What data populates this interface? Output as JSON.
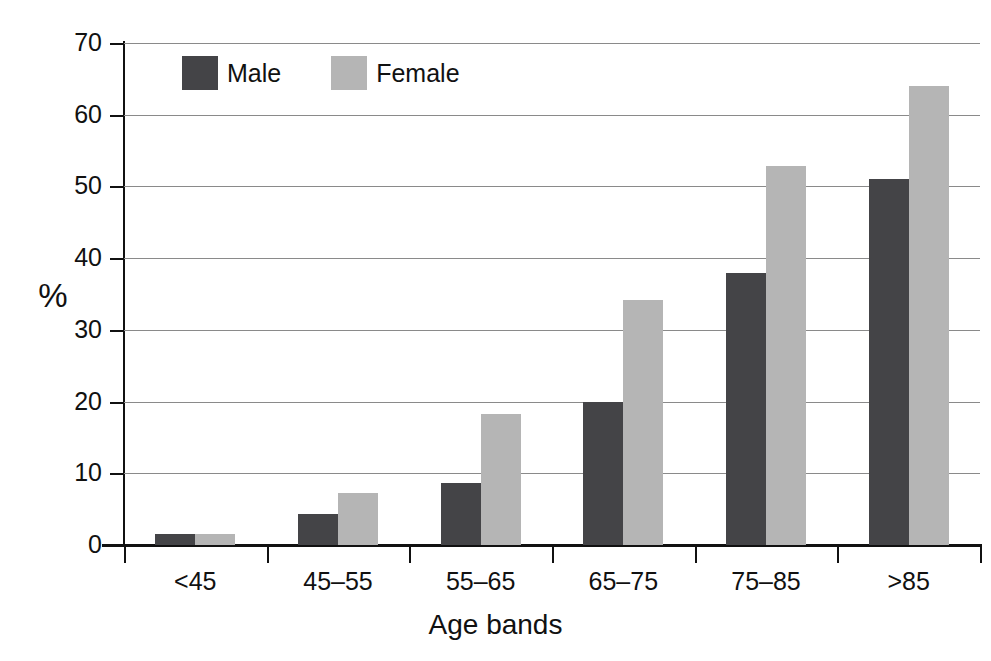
{
  "chart_data": {
    "type": "bar",
    "title": "",
    "subtitle": "",
    "xlabel": "Age bands",
    "ylabel": "%",
    "categories": [
      "<45",
      "45–55",
      "55–65",
      "65–75",
      "75–85",
      ">85"
    ],
    "series": [
      {
        "name": "Male",
        "color": "#444447",
        "values": [
          1.5,
          4.3,
          8.6,
          20.0,
          38.0,
          51.0
        ]
      },
      {
        "name": "Female",
        "color": "#b5b5b5",
        "values": [
          1.6,
          7.3,
          18.3,
          34.2,
          52.8,
          64.0
        ]
      }
    ],
    "ylim": [
      0,
      70
    ],
    "ytick_values": [
      0,
      10,
      20,
      30,
      40,
      50,
      60,
      70
    ],
    "ytick_labels": [
      "0",
      "10",
      "20",
      "30",
      "40",
      "50",
      "60",
      "70"
    ],
    "grid": true,
    "grid_axis": "y",
    "legend_position": "top-left-inside",
    "annotations": []
  },
  "axis": {
    "y_title": "%",
    "x_title": "Age bands"
  },
  "legend": {
    "items": [
      {
        "label": "Male",
        "color": "#444447"
      },
      {
        "label": "Female",
        "color": "#b5b5b5"
      }
    ]
  },
  "colors": {
    "male": "#444447",
    "female": "#b5b5b5",
    "gridline": "#8a8a8a",
    "axis": "#111111",
    "background": "#ffffff"
  }
}
